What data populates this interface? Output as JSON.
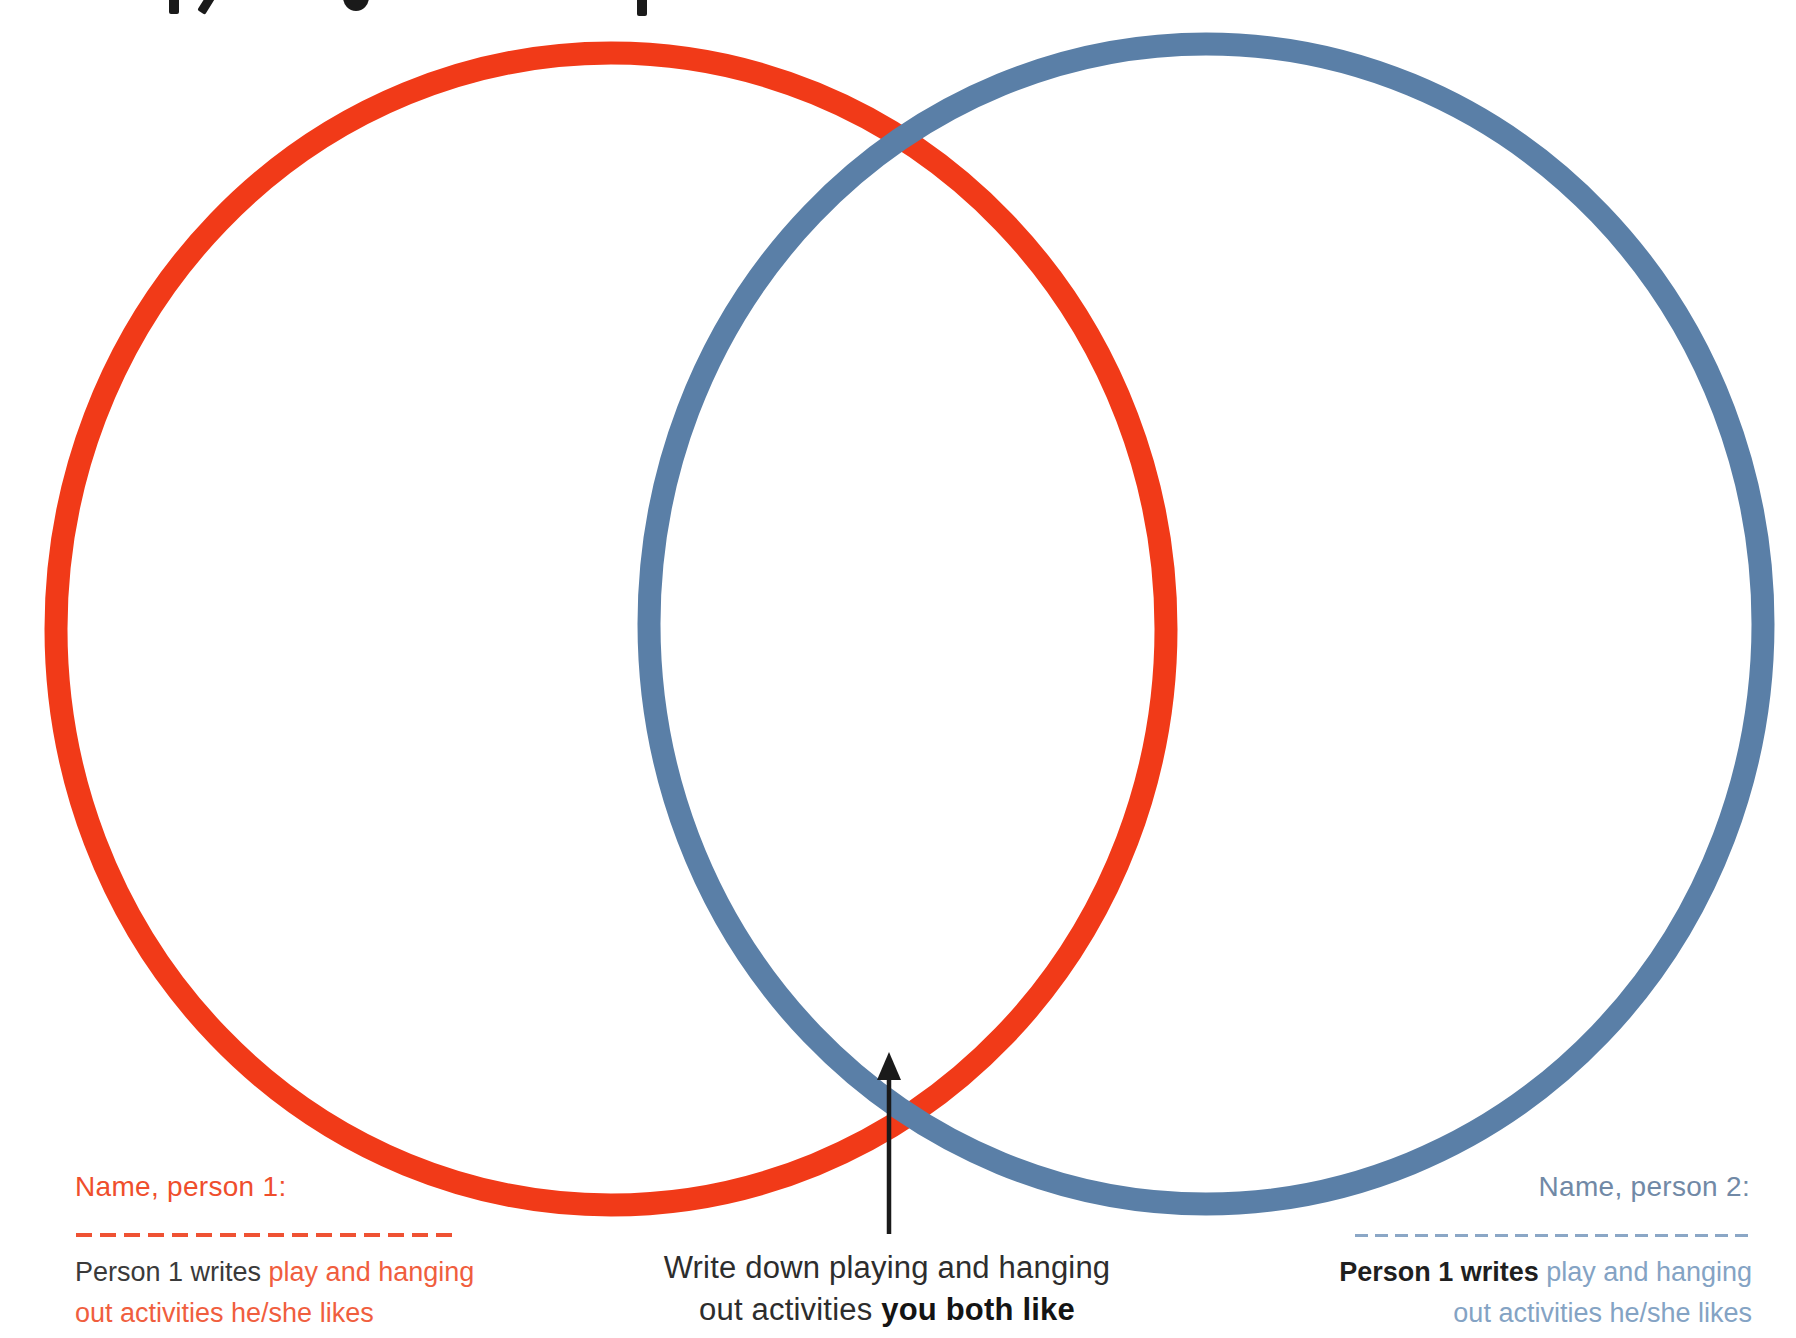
{
  "colors": {
    "red_circle": "#f13a18",
    "blue_circle": "#5a7fa7",
    "orange_heading": "#ef4e2c",
    "orange_body": "#f05e3e",
    "orange_dash": "#ef5233",
    "blue_heading": "#7189a6",
    "blue_body": "#84a3c4",
    "blue_dash": "#8ba7c6",
    "dark_text": "#3a3a3a",
    "right_black_text": "#1f1f1f",
    "caption_text": "#2d2d2d",
    "caption_bold": "#141414",
    "arrow_color": "#1a1a1a",
    "page_bg": "#ffffff"
  },
  "diagram": {
    "type": "venn",
    "left_circle_color_meaning": "Person 1 activities",
    "right_circle_color_meaning": "Person 2 activities"
  },
  "left_block": {
    "heading": "Name, person 1:",
    "line1_black": "Person 1 writes ",
    "line1_colored": "play and hanging",
    "line2_colored": "out activities he/she likes"
  },
  "right_block": {
    "heading": "Name, person 2:",
    "line1_black": "Person 1 writes ",
    "line1_colored": "play and hanging",
    "line2_colored": "out activities he/she likes"
  },
  "center_caption": {
    "line1": "Write down playing and hanging",
    "line2_regular": "out activities ",
    "line2_bold": "you both like"
  }
}
